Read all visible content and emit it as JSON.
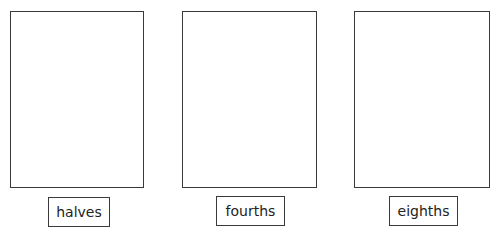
{
  "panels": [
    {
      "label": "halves",
      "rect": {
        "x": 10,
        "y": 11,
        "w": 134,
        "h": 177
      },
      "box": {
        "x": 48,
        "y": 197,
        "w": 62,
        "h": 30
      }
    },
    {
      "label": "fourths",
      "rect": {
        "x": 182,
        "y": 11,
        "w": 135,
        "h": 177
      },
      "box": {
        "x": 216,
        "y": 196,
        "w": 69,
        "h": 30
      }
    },
    {
      "label": "eighths",
      "rect": {
        "x": 354,
        "y": 11,
        "w": 136,
        "h": 177
      },
      "box": {
        "x": 389,
        "y": 196,
        "w": 69,
        "h": 30
      }
    }
  ],
  "colors": {
    "stroke": "#3a3a3a",
    "text": "#222222",
    "background": "#ffffff"
  }
}
